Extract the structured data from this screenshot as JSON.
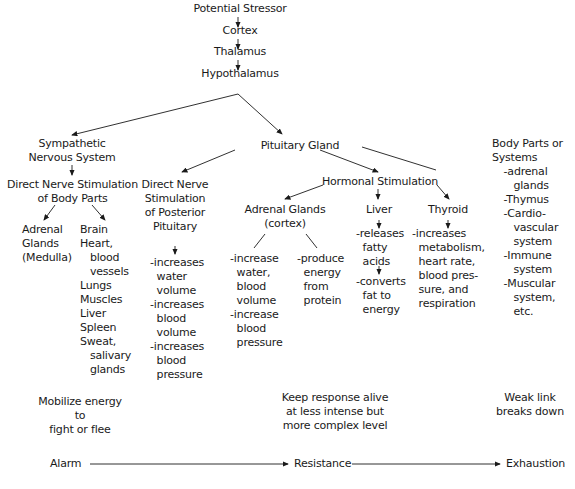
{
  "chain": {
    "stressor": "Potential Stressor",
    "cortex": "Cortex",
    "thalamus": "Thalamus",
    "hypothalamus": "Hypothalamus"
  },
  "sympathetic": {
    "title": "Sympathetic\nNervous System",
    "direct": "Direct Nerve Stimulation\nof Body Parts",
    "adrenal_medulla": "Adrenal\nGlands\n(Medulla)",
    "body_parts": "Brain\nHeart,\n   blood\n   vessels\nLungs\nMuscles\nLiver\nSpleen\nSweat,\n   salivary\n   glands"
  },
  "pituitary": {
    "title": "Pituitary Gland",
    "posterior": "Direct Nerve\nStimulation\nof Posterior\nPituitary",
    "posterior_effects": "-increases\n  water\n  volume\n-increases\n  blood\n  volume\n-increases\n  blood\n  pressure",
    "hormonal": "Hormonal Stimulation",
    "adrenal_cortex": "Adrenal Glands\n(cortex)",
    "cortex_effects_left": "-increase\n  water,\n  blood\n  volume\n-increase\n  blood\n  pressure",
    "cortex_effects_right": "-produce\n  energy\n  from\n  protein",
    "liver": "Liver",
    "liver_effect_1": "-releases\n  fatty\n  acids",
    "liver_effect_2": "-converts\n  fat to\n  energy",
    "thyroid": "Thyroid",
    "thyroid_effects": "-increases\n  metabolism,\n  heart rate,\n  blood pres-\n  sure, and\n  respiration"
  },
  "systems": {
    "title": "Body Parts or\nSystems",
    "items": "  -adrenal\n     glands\n  -Thymus\n  -Cardio-\n     vascular\n     system\n  -Immune\n     system\n  -Muscular\n     system,\n     etc."
  },
  "stages": {
    "alarm_desc": "Mobilize energy\nto\nfight or flee",
    "resistance_desc": "Keep response alive\nat less intense but\nmore complex level",
    "exhaustion_desc": "Weak link\nbreaks down",
    "alarm": "Alarm",
    "resistance": "Resistance",
    "exhaustion": "Exhaustion"
  }
}
